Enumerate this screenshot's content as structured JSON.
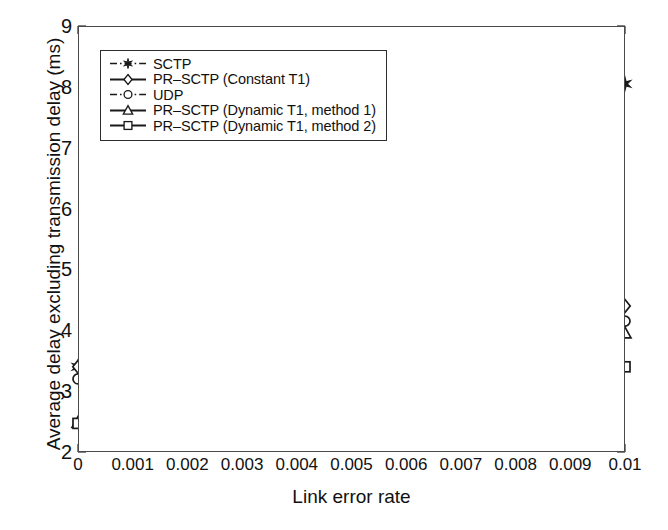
{
  "chart_data": {
    "type": "line",
    "title": "",
    "xlabel": "Link error rate",
    "ylabel": "Average delay excluding transmission delay (ms)",
    "xlim": [
      0,
      0.01
    ],
    "ylim": [
      2,
      9
    ],
    "grid": false,
    "legend_position": "upper left",
    "x": [
      0,
      0.005,
      0.01
    ],
    "xticks": [
      "0",
      "0.001",
      "0.002",
      "0.003",
      "0.004",
      "0.005",
      "0.006",
      "0.007",
      "0.008",
      "0.009",
      "0.01"
    ],
    "xtick_values": [
      0,
      0.001,
      0.002,
      0.003,
      0.004,
      0.005,
      0.006,
      0.007,
      0.008,
      0.009,
      0.01
    ],
    "yticks": [
      "2",
      "3",
      "4",
      "5",
      "6",
      "7",
      "8",
      "9"
    ],
    "ytick_values": [
      2,
      3,
      4,
      5,
      6,
      7,
      8,
      9
    ],
    "series": [
      {
        "name": "SCTP",
        "marker": "star",
        "linestyle": "dashdot",
        "color": "#1a1a1a",
        "values": [
          3.4,
          5.18,
          8.05
        ]
      },
      {
        "name": "PR-SCTP (Constant T1)",
        "marker": "diamond",
        "linestyle": "solid",
        "color": "#1a1a1a",
        "values": [
          3.4,
          3.35,
          4.4
        ]
      },
      {
        "name": "UDP",
        "marker": "circle",
        "linestyle": "dashdot",
        "color": "#1a1a1a",
        "values": [
          3.2,
          3.2,
          4.15
        ]
      },
      {
        "name": "PR-SCTP (Dynamic T1, method 1)",
        "marker": "triangle",
        "linestyle": "solid",
        "color": "#1a1a1a",
        "values": [
          2.48,
          3.15,
          3.95
        ]
      },
      {
        "name": "PR-SCTP (Dynamic T1, method 2)",
        "marker": "square",
        "linestyle": "solid",
        "color": "#1a1a1a",
        "values": [
          2.47,
          3.0,
          3.4
        ]
      }
    ]
  },
  "caption": {
    "scrap": ""
  }
}
